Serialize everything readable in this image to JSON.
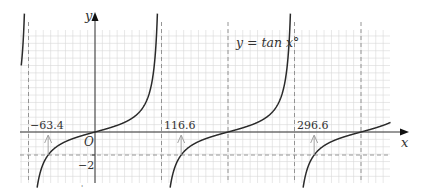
{
  "chart_data": {
    "type": "line",
    "title": "",
    "function_label": "y = tan x°",
    "xlabel": "x",
    "ylabel": "y",
    "origin_label": "O",
    "xlim": [
      -100,
      450
    ],
    "ylim": [
      -4.4,
      8.7
    ],
    "grid": true,
    "grid_minor_step_deg": 10,
    "asymptotes_deg": [
      -90,
      90,
      270
    ],
    "reference_dashed_verticals_deg": [
      -90,
      90,
      180,
      270,
      360
    ],
    "reference_dashed_horizontal_y": -2,
    "marked_solutions": [
      {
        "x": -63.4,
        "label": "-63.4"
      },
      {
        "x": 116.6,
        "label": "116.6"
      },
      {
        "x": 296.6,
        "label": "296.6"
      }
    ],
    "y_tick_labels": [
      {
        "value": -2,
        "label": "-2"
      }
    ],
    "series": [
      {
        "name": "y = tan x°",
        "branch_domains_deg": [
          [
            -100,
            -90
          ],
          [
            -90,
            90
          ],
          [
            90,
            270
          ],
          [
            270,
            400
          ]
        ]
      }
    ]
  },
  "labels": {
    "function": "y = tan x°",
    "x_axis": "x",
    "y_axis": "y",
    "origin": "O",
    "sol1": "−63.4",
    "sol2": "116.6",
    "sol3": "296.6",
    "ytick_neg2": "−2",
    "footer_mark": "'"
  },
  "colors": {
    "curve": "#2a2a2a",
    "axis": "#333333",
    "grid": "#d9d9d9",
    "dashed": "#8a8a8a"
  }
}
